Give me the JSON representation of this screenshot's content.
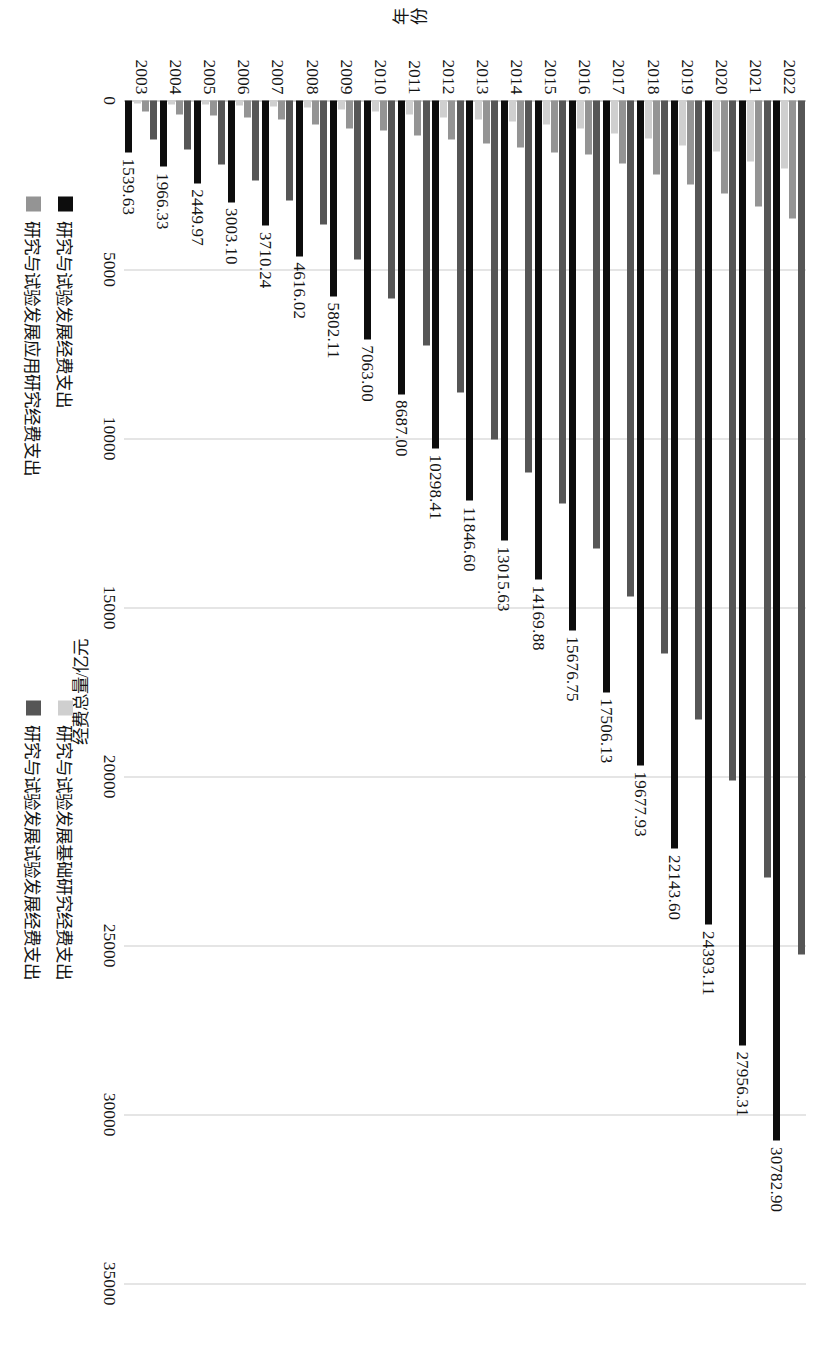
{
  "chart_data": {
    "type": "bar",
    "orientation": "horizontal",
    "title": "",
    "xlabel": "年份",
    "ylabel": "经费总量/亿元",
    "xlim": [
      0,
      35000
    ],
    "grid": true,
    "gridline_step": 5000,
    "legend_position": "bottom",
    "tick_labels": [
      "0",
      "5000",
      "10000",
      "15000",
      "20000",
      "25000",
      "30000",
      "35000"
    ],
    "categories": [
      "2003",
      "2004",
      "2005",
      "2006",
      "2007",
      "2008",
      "2009",
      "2010",
      "2011",
      "2012",
      "2013",
      "2014",
      "2015",
      "2016",
      "2017",
      "2018",
      "2019",
      "2020",
      "2021",
      "2022"
    ],
    "series": [
      {
        "name": "研究与试验发展经费支出",
        "color": "#0d0d0d",
        "legend_group": "left",
        "show_labels": true,
        "values": [
          1539.63,
          1966.33,
          2449.97,
          3003.1,
          3710.24,
          4616.02,
          5802.11,
          7063.0,
          8687.0,
          10298.41,
          11846.6,
          13015.63,
          14169.88,
          15676.75,
          17506.13,
          19677.93,
          22143.6,
          24393.11,
          27956.31,
          30782.9
        ]
      },
      {
        "name": "研究与试验发展应用研究经费支出",
        "color": "#949494",
        "legend_group": "left",
        "show_labels": false,
        "values": [
          310.68,
          399.81,
          433.52,
          489.03,
          567.25,
          715.05,
          833.54,
          893.8,
          1028.4,
          1162.0,
          1269.1,
          1398.5,
          1528.7,
          1610.5,
          1849.2,
          2190.9,
          2498.5,
          2757.2,
          3145.4,
          3482.5
        ]
      },
      {
        "name": "研究与试验发展基础研究经费支出",
        "color": "#cfcfcf",
        "legend_group": "right",
        "show_labels": false,
        "values": [
          87.65,
          117.24,
          131.21,
          155.76,
          174.52,
          220.82,
          270.3,
          324.5,
          411.8,
          498.8,
          555.0,
          613.5,
          716.1,
          822.9,
          975.5,
          1118.6,
          1335.6,
          1504.1,
          1817.0,
          2023.5
        ]
      },
      {
        "name": "研究与试验发展试验发展经费支出",
        "color": "#565656",
        "legend_group": "right",
        "show_labels": false,
        "values": [
          1141.3,
          1449.28,
          1885.24,
          2358.31,
          2968.47,
          3680.15,
          4698.27,
          5844.7,
          7246.8,
          8637.61,
          10022.5,
          11003.63,
          11925.08,
          13243.35,
          14681.43,
          16368.43,
          18309.5,
          20131.81,
          22993.91,
          25276.9
        ]
      }
    ],
    "legend_groups": {
      "left": [
        {
          "label": "研究与试验发展经费支出",
          "color": "#0d0d0d"
        },
        {
          "label": "研究与试验发展应用研究经费支出",
          "color": "#949494"
        }
      ],
      "right": [
        {
          "label": "研究与试验发展基础研究经费支出",
          "color": "#cfcfcf"
        },
        {
          "label": "研究与试验发展试验发展经费支出",
          "color": "#565656"
        }
      ]
    },
    "data_labels": [
      "1539.63",
      "1966.33",
      "2449.97",
      "3003.10",
      "3710.24",
      "4616.02",
      "5802.11",
      "7063.00",
      "8687.00",
      "10298.41",
      "11846.60",
      "13015.63",
      "14169.88",
      "15676.75",
      "17506.13",
      "19677.93",
      "22143.60",
      "24393.11",
      "27956.31",
      "30782.90"
    ]
  }
}
